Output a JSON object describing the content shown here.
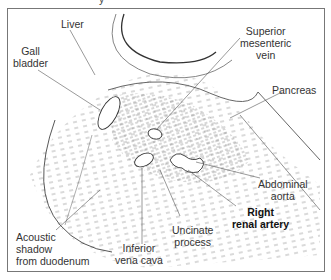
{
  "diagram": {
    "type": "anatomical ultrasound schematic (transverse section, upper abdomen)",
    "top_cut_text": "y",
    "labels": [
      {
        "id": "liver",
        "text": "Liver"
      },
      {
        "id": "gall-bladder",
        "lines": [
          "Gall",
          "bladder"
        ]
      },
      {
        "id": "superior-mesenteric-vein",
        "lines": [
          "Superior",
          "mesenteric",
          "vein"
        ]
      },
      {
        "id": "pancreas",
        "text": "Pancreas"
      },
      {
        "id": "abdominal-aorta",
        "lines": [
          "Abdominal",
          "aorta"
        ]
      },
      {
        "id": "right-renal-artery",
        "lines": [
          "Right",
          "renal artery"
        ],
        "emphasis": "bold"
      },
      {
        "id": "uncinate-process",
        "lines": [
          "Uncinate",
          "process"
        ]
      },
      {
        "id": "inferior-vena-cava",
        "lines": [
          "Inferior",
          "vena cava"
        ]
      },
      {
        "id": "acoustic-shadow",
        "lines": [
          "Acoustic",
          "shadow",
          "from duodenum"
        ]
      }
    ],
    "colors": {
      "line": "#444444",
      "stipple": "#8a8a8a",
      "frame": "#777777",
      "background": "#ffffff"
    }
  }
}
